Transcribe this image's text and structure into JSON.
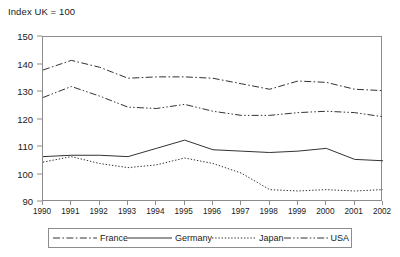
{
  "chart_data": {
    "type": "line",
    "title": "Index UK = 100",
    "xlabel": "",
    "ylabel": "",
    "xlim": [
      1990,
      2002
    ],
    "ylim": [
      90,
      150
    ],
    "yticks": [
      150,
      140,
      130,
      120,
      110,
      100,
      90
    ],
    "grid": false,
    "legend_position": "bottom",
    "categories": [
      "1990",
      "1991",
      "1992",
      "1993",
      "1994",
      "1995",
      "1996",
      "1997",
      "1998",
      "1999",
      "2000",
      "2001",
      "2002"
    ],
    "series": [
      {
        "name": "France",
        "style": "dash-dot",
        "color": "#333333",
        "values": [
          138.0,
          141.5,
          139.0,
          135.0,
          135.5,
          135.5,
          135.0,
          133.0,
          131.0,
          134.0,
          133.5,
          131.0,
          130.5
        ]
      },
      {
        "name": "Germany",
        "style": "solid",
        "color": "#333333",
        "values": [
          106.5,
          107.0,
          107.0,
          106.5,
          109.5,
          112.5,
          109.0,
          108.5,
          108.0,
          108.5,
          109.5,
          105.5,
          105.0
        ]
      },
      {
        "name": "Japan",
        "style": "dotted",
        "color": "#333333",
        "values": [
          104.5,
          106.5,
          104.0,
          102.5,
          103.5,
          106.0,
          104.0,
          100.5,
          94.5,
          94.0,
          94.5,
          94.0,
          94.5
        ]
      },
      {
        "name": "USA",
        "style": "dash-dot-dot",
        "color": "#333333",
        "values": [
          128.0,
          132.0,
          128.5,
          124.5,
          124.0,
          125.5,
          123.0,
          121.5,
          121.5,
          122.5,
          123.0,
          122.5,
          121.0
        ]
      }
    ]
  },
  "legend": {
    "items": [
      {
        "label": "France"
      },
      {
        "label": "Germany"
      },
      {
        "label": "Japan"
      },
      {
        "label": "USA"
      }
    ]
  }
}
